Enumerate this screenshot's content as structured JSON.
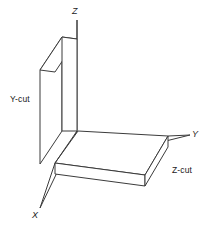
{
  "figure": {
    "background_color": "#ffffff",
    "line_color": "#3b3b3b",
    "text_color": "#1a1a1a",
    "axes": [
      {
        "name": "z-axis",
        "label": "Z",
        "direction": "up"
      },
      {
        "name": "y-axis",
        "label": "Y",
        "direction": "right"
      },
      {
        "name": "x-axis",
        "label": "X",
        "direction": "down-left"
      }
    ],
    "plates": [
      {
        "name": "y-cut-plate",
        "label": "Y-cut",
        "orientation": "vertical",
        "plane": "XZ"
      },
      {
        "name": "z-cut-plate",
        "label": "Z-cut",
        "orientation": "horizontal",
        "plane": "XY"
      }
    ],
    "labels": {
      "z_axis": "Z",
      "y_axis": "Y",
      "x_axis": "X",
      "y_cut": "Y-cut",
      "z_cut": "Z-cut"
    }
  }
}
